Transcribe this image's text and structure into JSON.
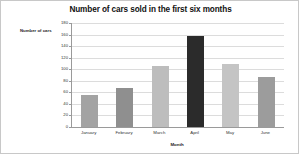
{
  "chart_data": {
    "type": "bar",
    "title": "Number of cars sold in the first six months",
    "xlabel": "Month",
    "ylabel": "Number of cars",
    "categories": [
      "January",
      "February",
      "March",
      "April",
      "May",
      "June"
    ],
    "values": [
      56,
      67,
      105,
      157,
      109,
      87
    ],
    "bar_colors": [
      "#a3a3a3",
      "#8f8f8f",
      "#bdbdbd",
      "#2b2b2b",
      "#c4c4c4",
      "#9c9c9c"
    ],
    "ylim": [
      0,
      180
    ],
    "ytick_labels": [
      "180",
      "160",
      "140",
      "120",
      "100",
      "80",
      "60",
      "40",
      "20",
      "0"
    ],
    "ytick_values": [
      180,
      160,
      140,
      120,
      100,
      80,
      60,
      40,
      20,
      0
    ],
    "grid": true,
    "legend": false,
    "background_color": "#ffffff",
    "gridline_color": "#dcdcdc",
    "axis_color": "#9a9a9a"
  }
}
